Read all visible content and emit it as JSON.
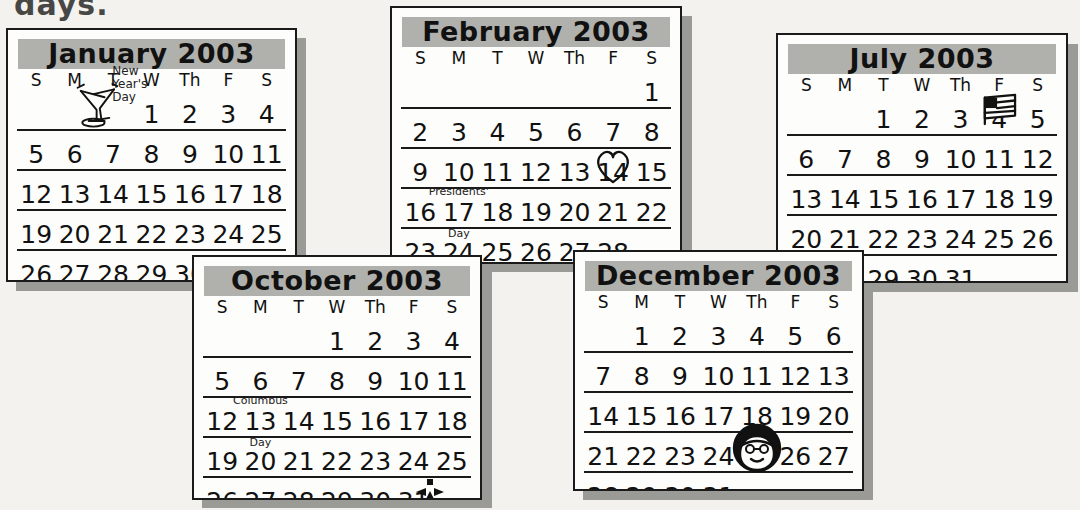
{
  "page": {
    "cut_off_heading": "days.",
    "background_color": "#f3f2ee",
    "ink_color": "#111111",
    "title_band_color": "#b0b0ac",
    "shadow_color": "#9a9a96"
  },
  "weekday_headers": [
    "S",
    "M",
    "T",
    "W",
    "Th",
    "F",
    "S"
  ],
  "calendars": [
    {
      "id": "january",
      "title": "January 2003",
      "weeks": [
        [
          "",
          "",
          "",
          "1",
          "2",
          "3",
          "4"
        ],
        [
          "5",
          "6",
          "7",
          "8",
          "9",
          "10",
          "11"
        ],
        [
          "12",
          "13",
          "14",
          "15",
          "16",
          "17",
          "18"
        ],
        [
          "19",
          "20",
          "21",
          "22",
          "23",
          "24",
          "25"
        ],
        [
          "26",
          "27",
          "28",
          "29",
          "30",
          "31",
          ""
        ]
      ],
      "annotations": [
        {
          "day": "1",
          "label_lines": [
            "New",
            "Year's",
            "Day"
          ]
        }
      ],
      "icons": [
        {
          "day": "1",
          "name": "champagne-glasses-icon"
        }
      ]
    },
    {
      "id": "february",
      "title": "February 2003",
      "weeks": [
        [
          "",
          "",
          "",
          "",
          "",
          "",
          "1"
        ],
        [
          "2",
          "3",
          "4",
          "5",
          "6",
          "7",
          "8"
        ],
        [
          "9",
          "10",
          "11",
          "12",
          "13",
          "14",
          "15"
        ],
        [
          "16",
          "17",
          "18",
          "19",
          "20",
          "21",
          "22"
        ],
        [
          "23",
          "24",
          "25",
          "26",
          "27",
          "28",
          ""
        ]
      ],
      "annotations": [
        {
          "day": "17",
          "label_lines": [
            "Presidents'",
            "Day"
          ]
        }
      ],
      "icons": [
        {
          "day": "14",
          "name": "heart-icon"
        }
      ]
    },
    {
      "id": "july",
      "title": "July 2003",
      "weeks": [
        [
          "",
          "",
          "1",
          "2",
          "3",
          "4",
          "5"
        ],
        [
          "6",
          "7",
          "8",
          "9",
          "10",
          "11",
          "12"
        ],
        [
          "13",
          "14",
          "15",
          "16",
          "17",
          "18",
          "19"
        ],
        [
          "20",
          "21",
          "22",
          "23",
          "24",
          "25",
          "26"
        ],
        [
          "27",
          "28",
          "29",
          "30",
          "31",
          "",
          ""
        ]
      ],
      "annotations": [],
      "icons": [
        {
          "day": "4",
          "name": "american-flag-icon"
        }
      ]
    },
    {
      "id": "october",
      "title": "October 2003",
      "weeks": [
        [
          "",
          "",
          "",
          "1",
          "2",
          "3",
          "4"
        ],
        [
          "5",
          "6",
          "7",
          "8",
          "9",
          "10",
          "11"
        ],
        [
          "12",
          "13",
          "14",
          "15",
          "16",
          "17",
          "18"
        ],
        [
          "19",
          "20",
          "21",
          "22",
          "23",
          "24",
          "25"
        ],
        [
          "26",
          "27",
          "28",
          "29",
          "30",
          "31",
          ""
        ]
      ],
      "annotations": [
        {
          "day": "13",
          "label_lines": [
            "Columbus",
            "Day"
          ]
        }
      ],
      "icons": [
        {
          "day": "31",
          "name": "jack-o-lantern-icon"
        }
      ]
    },
    {
      "id": "december",
      "title": "December 2003",
      "weeks": [
        [
          "",
          "1",
          "2",
          "3",
          "4",
          "5",
          "6"
        ],
        [
          "7",
          "8",
          "9",
          "10",
          "11",
          "12",
          "13"
        ],
        [
          "14",
          "15",
          "16",
          "17",
          "18",
          "19",
          "20"
        ],
        [
          "21",
          "22",
          "23",
          "24",
          "25",
          "26",
          "27"
        ],
        [
          "28",
          "29",
          "30",
          "31",
          "",
          "",
          ""
        ]
      ],
      "annotations": [],
      "icons": [
        {
          "day": "25",
          "name": "santa-face-icon"
        }
      ]
    }
  ]
}
